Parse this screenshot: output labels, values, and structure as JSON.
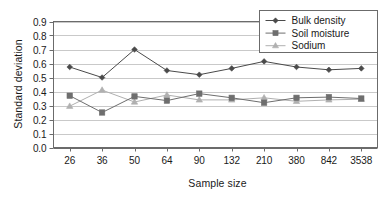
{
  "chart_data": {
    "type": "line",
    "title": "",
    "xlabel": "Sample size",
    "ylabel": "Standard deviation",
    "categories": [
      "26",
      "36",
      "50",
      "64",
      "90",
      "132",
      "210",
      "380",
      "842",
      "3538"
    ],
    "ylim": [
      0.0,
      0.9
    ],
    "yticks": [
      "0.0",
      "0.1",
      "0.2",
      "0.3",
      "0.4",
      "0.5",
      "0.6",
      "0.7",
      "0.8",
      "0.9"
    ],
    "grid": "horizontal",
    "legend_position": "top-right",
    "series": [
      {
        "name": "Bulk density",
        "marker": "diamond",
        "color": "#4a4a4a",
        "values": [
          0.575,
          0.5,
          0.7,
          0.55,
          0.52,
          0.565,
          0.615,
          0.575,
          0.555,
          0.565
        ]
      },
      {
        "name": "Soil moisture",
        "marker": "square",
        "color": "#6e6e6e",
        "values": [
          0.37,
          0.25,
          0.365,
          0.335,
          0.385,
          0.355,
          0.32,
          0.355,
          0.36,
          0.35
        ]
      },
      {
        "name": "Sodium",
        "marker": "triangle",
        "color": "#b0b0b0",
        "values": [
          0.295,
          0.41,
          0.325,
          0.375,
          0.34,
          0.34,
          0.355,
          0.33,
          0.34,
          0.345
        ]
      }
    ]
  },
  "axes": {
    "frame_color": "#6b6b6b",
    "grid_color": "#c9c9c9"
  }
}
